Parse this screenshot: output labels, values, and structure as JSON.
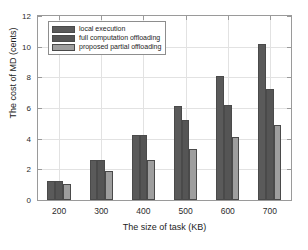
{
  "chart_data": {
    "type": "bar",
    "title": "",
    "xlabel": "The size of task (KB)",
    "ylabel": "The cost of MD (cents)",
    "categories": [
      "200",
      "300",
      "400",
      "500",
      "600",
      "700"
    ],
    "series": [
      {
        "name": "local execution",
        "color": "#5a5a5a",
        "values": [
          1.22,
          2.58,
          4.25,
          6.12,
          8.08,
          10.15
        ]
      },
      {
        "name": "full computation offloading",
        "color": "#555555",
        "values": [
          1.22,
          2.58,
          4.22,
          5.22,
          6.22,
          7.25
        ]
      },
      {
        "name": "proposed partial offloading",
        "color": "#9e9e9e",
        "values": [
          1.05,
          1.88,
          2.6,
          3.35,
          4.1,
          4.88
        ]
      }
    ],
    "ylim": [
      0,
      12
    ],
    "yticks": [
      "0",
      "2",
      "4",
      "6",
      "8",
      "10",
      "12"
    ],
    "grid": true,
    "legend_position": "top-left"
  }
}
